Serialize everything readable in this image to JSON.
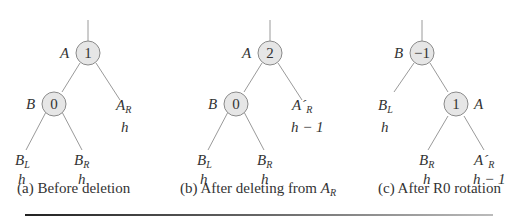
{
  "panels": [
    {
      "caption_prefix": "(a) Before deletion",
      "caption_sub": "",
      "root": {
        "name": "A",
        "balance": "1"
      },
      "child": {
        "name": "B",
        "balance": "0"
      },
      "subtrees": [
        {
          "name": "B",
          "sub": "L",
          "prime": "",
          "height": "h"
        },
        {
          "name": "B",
          "sub": "R",
          "prime": "",
          "height": "h"
        },
        {
          "name": "A",
          "sub": "R",
          "prime": "",
          "height": "h"
        }
      ]
    },
    {
      "caption_prefix": "(b) After deleting from ",
      "caption_sub": "R",
      "caption_var": "A",
      "root": {
        "name": "A",
        "balance": "2"
      },
      "child": {
        "name": "B",
        "balance": "0"
      },
      "subtrees": [
        {
          "name": "B",
          "sub": "L",
          "prime": "",
          "height": "h"
        },
        {
          "name": "B",
          "sub": "R",
          "prime": "",
          "height": "h"
        },
        {
          "name": "A",
          "sub": "R",
          "prime": "´",
          "height": "h − 1"
        }
      ]
    },
    {
      "caption_prefix": "(c) After R0 rotation",
      "caption_sub": "",
      "root": {
        "name": "B",
        "balance": "−1"
      },
      "child": {
        "name": "A",
        "balance": "1"
      },
      "subtrees": [
        {
          "name": "B",
          "sub": "L",
          "prime": "",
          "height": "h"
        },
        {
          "name": "B",
          "sub": "R",
          "prime": "",
          "height": "h"
        },
        {
          "name": "A",
          "sub": "R",
          "prime": "´",
          "height": "h − 1"
        }
      ]
    }
  ]
}
